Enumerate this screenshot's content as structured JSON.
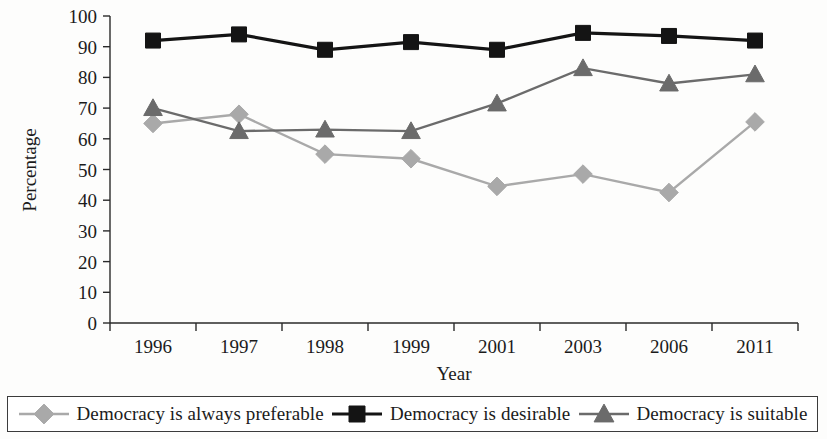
{
  "chart_data": {
    "type": "line",
    "title": "",
    "xlabel": "Year",
    "ylabel": "Percentage",
    "categories": [
      "1996",
      "1997",
      "1998",
      "1999",
      "2001",
      "2003",
      "2006",
      "2011"
    ],
    "ylim": [
      0,
      100
    ],
    "ytick_step": 10,
    "yticks": [
      "0",
      "10",
      "20",
      "30",
      "40",
      "50",
      "60",
      "70",
      "80",
      "90",
      "100"
    ],
    "grid": false,
    "legend_position": "bottom",
    "series": [
      {
        "name": "Democracy is always preferable",
        "marker": "diamond",
        "color": "#a9a9a9",
        "values": [
          65,
          68,
          55,
          53.5,
          44.5,
          48.5,
          42.5,
          65.5
        ]
      },
      {
        "name": "Democracy is desirable",
        "marker": "square",
        "color": "#141414",
        "values": [
          92,
          94,
          89,
          91.5,
          89,
          94.5,
          93.5,
          92
        ]
      },
      {
        "name": "Democracy is suitable",
        "marker": "triangle",
        "color": "#6b6b6b",
        "values": [
          70,
          62.5,
          63,
          62.5,
          71.5,
          83,
          78,
          81
        ]
      }
    ]
  },
  "legend": {
    "items": [
      {
        "label": "Democracy is always preferable",
        "marker": "diamond",
        "color": "#a9a9a9"
      },
      {
        "label": "Democracy is desirable",
        "marker": "square",
        "color": "#141414"
      },
      {
        "label": "Democracy is suitable",
        "marker": "triangle",
        "color": "#6b6b6b"
      }
    ]
  }
}
